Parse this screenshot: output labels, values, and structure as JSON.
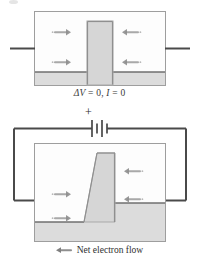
{
  "figure": {
    "title_semantic": "electron-flow-across-potential-barrier",
    "colors": {
      "wire": "#4a4a4a",
      "box_border": "#9a9a9a",
      "barrier_fill": "#d6d6d6",
      "barrier_edge": "#a8a8a8",
      "floor_fill": "#d9d9d9",
      "arrow": "#8e8e8e",
      "text": "#2b2b2b",
      "background": "#ffffff"
    }
  },
  "panel_top": {
    "name": "equilibrium-panel",
    "caption": {
      "delta_v_symbol": "ΔV",
      "equals": " = ",
      "delta_v_value": "0",
      "separator": ", ",
      "current_symbol": "I",
      "current_value": "0",
      "full_text": "ΔV = 0, I = 0"
    },
    "arrows": [
      {
        "name": "electron-arrow-left-upper",
        "direction": "right"
      },
      {
        "name": "electron-arrow-left-lower",
        "direction": "right"
      },
      {
        "name": "electron-arrow-right-upper",
        "direction": "left"
      },
      {
        "name": "electron-arrow-right-lower",
        "direction": "left"
      }
    ],
    "barrier": {
      "name": "symmetric-barrier",
      "shape": "vertical-column"
    },
    "wires": [
      {
        "name": "lead-wire-left"
      },
      {
        "name": "lead-wire-right"
      }
    ]
  },
  "panel_bottom": {
    "name": "biased-panel",
    "battery": {
      "name": "battery-symbol",
      "polarity_label": "+",
      "cells": 2
    },
    "caption": {
      "legend_text": "Net electron flow",
      "legend_arrow_direction": "left"
    },
    "arrows": [
      {
        "name": "electron-arrow-left-upper",
        "direction": "right"
      },
      {
        "name": "electron-arrow-left-lower",
        "direction": "right"
      },
      {
        "name": "electron-arrow-right-upper",
        "direction": "left"
      },
      {
        "name": "electron-arrow-right-lower",
        "direction": "left"
      }
    ],
    "barrier": {
      "name": "tilted-barrier",
      "shape": "slanted-column"
    },
    "wires": [
      {
        "name": "circuit-wire-left"
      },
      {
        "name": "circuit-wire-right"
      },
      {
        "name": "circuit-wire-top-left"
      },
      {
        "name": "circuit-wire-top-right"
      }
    ]
  }
}
